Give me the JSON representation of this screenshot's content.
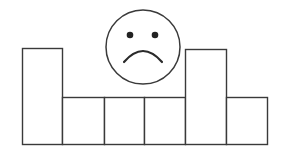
{
  "figure": {
    "stroke_color": "#3a3a3a",
    "fill_color": "#ffffff",
    "baseline_y": 144,
    "bars": [
      {
        "x": 22,
        "width": 40,
        "top": 48
      },
      {
        "x": 62,
        "width": 42,
        "top": 97
      },
      {
        "x": 104,
        "width": 40,
        "top": 97
      },
      {
        "x": 144,
        "width": 41,
        "top": 97
      },
      {
        "x": 185,
        "width": 41,
        "top": 49
      },
      {
        "x": 226,
        "width": 41,
        "top": 97
      }
    ],
    "face": {
      "cx": 143,
      "cy": 47,
      "r": 37,
      "eyes": [
        {
          "cx": 130,
          "cy": 35,
          "r": 3.3
        },
        {
          "cx": 155,
          "cy": 35,
          "r": 3.3
        }
      ],
      "mouth": {
        "x1": 124,
        "y1": 62,
        "cx": 143,
        "cy": 40,
        "x2": 162,
        "y2": 62
      },
      "expression": "sad"
    }
  }
}
